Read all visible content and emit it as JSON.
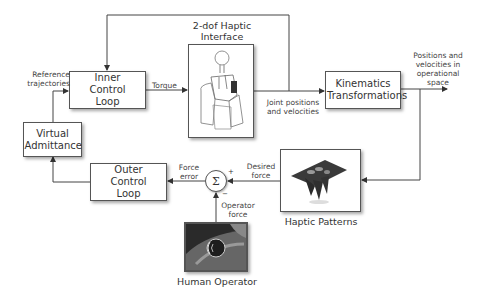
{
  "diagram": {
    "blocks": {
      "inner_control_loop": "Inner Control Loop",
      "virtual_admittance": "Virtual Admittance",
      "outer_control_loop": "Outer Control Loop",
      "kinematics_transformations": "Kinematics Transformations"
    },
    "images": {
      "haptic_interface_title": "2-dof Haptic Interface",
      "haptic_patterns_caption": "Haptic Patterns",
      "human_operator_caption": "Human Operator"
    },
    "signals": {
      "reference_trajectories": "Reference trajectories",
      "torque": "Torque",
      "joint_positions": "Joint positions and velocities",
      "operational_space": "Positions and velocities in operational space",
      "desired_force": "Desired force",
      "force_error": "Force error",
      "operator_force": "Operator force"
    },
    "summation": {
      "symbol": "Σ",
      "plus_sign": "+",
      "minus_sign": "−"
    },
    "colors": {
      "line": "#444444",
      "border": "#555555",
      "text": "#333333"
    }
  }
}
